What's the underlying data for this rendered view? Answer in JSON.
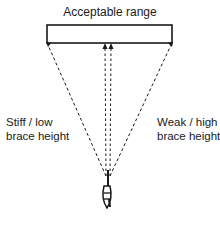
{
  "diagram": {
    "title": "Acceptable range",
    "left_label": {
      "line1": "Stiff / low",
      "line2": "brace height"
    },
    "right_label": {
      "line1": "Weak / high",
      "line2": "brace height"
    },
    "colors": {
      "stroke": "#1a1a1a",
      "background": "#ffffff"
    },
    "elements": {
      "range_box": "acceptable-range-box",
      "archer_icon": "archer-arrow-icon",
      "trajectories": [
        "left-trajectory",
        "center-trajectory-left",
        "center-trajectory-right",
        "right-trajectory"
      ]
    }
  }
}
